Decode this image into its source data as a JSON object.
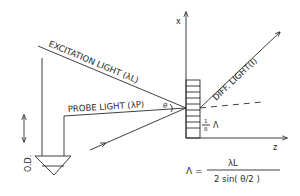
{
  "figure": {
    "axes": {
      "x_label": "x",
      "z_label": "z"
    },
    "beams": {
      "excitation": "EXCITATION LIGHT (λL)",
      "probe": "PROBE LIGHT (λP)",
      "diffracted": "DIFF. LIGHT(I)"
    },
    "angle_label": "θ",
    "detector_label": "O.D.",
    "spacing_label": {
      "numerator": "1",
      "denominator": "8",
      "symbol": "Λ"
    },
    "equation": {
      "lhs": "Λ =",
      "numerator": "λL",
      "denominator": "2 sin( θ/2 )"
    },
    "colors": {
      "ink": "#2a2a2a",
      "background": "#ffffff"
    }
  }
}
